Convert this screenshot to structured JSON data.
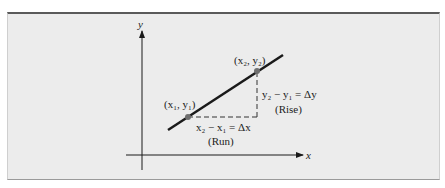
{
  "diagram": {
    "axes": {
      "x_label": "x",
      "y_label": "y"
    },
    "points": [
      {
        "id": "p1",
        "label": "(x₁, y₁)"
      },
      {
        "id": "p2",
        "label": "(x₂, y₂)"
      }
    ],
    "run": {
      "formula": "x₂ − x₁ = Δx",
      "caption": "(Run)"
    },
    "rise": {
      "formula": "y₂ − y₁ = Δy",
      "caption": "(Rise)"
    },
    "colors": {
      "line": "#1a1a1a",
      "point": "#6e6e6e",
      "background": "#ececec",
      "top_border": "#5a5a5a"
    }
  }
}
